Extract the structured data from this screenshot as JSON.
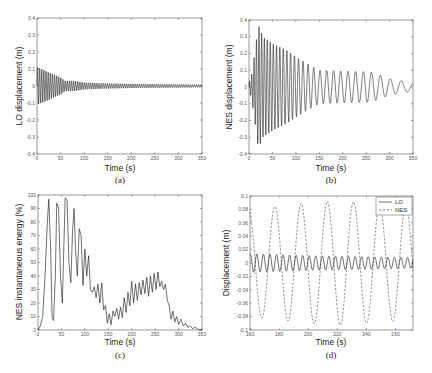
{
  "chart_data": [
    {
      "id": "a",
      "type": "line",
      "caption": "(a)",
      "xlabel": "Time (s)",
      "ylabel": "LO displacement (m)",
      "xlim": [
        0,
        350
      ],
      "ylim": [
        -0.4,
        0.4
      ],
      "xticks": [
        0,
        50,
        100,
        150,
        200,
        250,
        300,
        350
      ],
      "yticks": [
        -0.4,
        -0.3,
        -0.2,
        -0.1,
        0,
        0.1,
        0.2,
        0.3,
        0.4
      ],
      "ytick_labels": [
        "-0.4",
        "-0.3",
        "-0.2",
        "-0.1",
        "0",
        "0.1",
        "0.2",
        "0.3",
        "0.4"
      ],
      "grid": false,
      "series": [
        {
          "name": "LO",
          "style": "solid",
          "period_s": 4.5,
          "envelope": {
            "x": [
              0,
              10,
              30,
              50,
              60,
              80,
              100,
              150,
              200,
              350
            ],
            "y": [
              0.11,
              0.1,
              0.075,
              0.05,
              0.03,
              0.03,
              0.02,
              0.015,
              0.012,
              0.008
            ]
          }
        }
      ]
    },
    {
      "id": "b",
      "type": "line",
      "caption": "(b)",
      "xlabel": "Time (s)",
      "ylabel": "NES displacement (m)",
      "xlim": [
        0,
        350
      ],
      "ylim": [
        -0.4,
        0.4
      ],
      "xticks": [
        0,
        50,
        100,
        150,
        200,
        250,
        300,
        350
      ],
      "yticks": [
        -0.4,
        -0.3,
        -0.2,
        -0.1,
        0,
        0.1,
        0.2,
        0.3,
        0.4
      ],
      "ytick_labels": [
        "-0.4",
        "-0.3",
        "-0.2",
        "-0.1",
        "0",
        "0.1",
        "0.2",
        "0.3",
        "0.4"
      ],
      "grid": false,
      "series": [
        {
          "name": "NES",
          "style": "solid",
          "period_points": {
            "x": [
              0,
              20,
              100,
              150,
              250,
              300,
              350
            ],
            "y": [
              4.5,
              5.5,
              8.5,
              14,
              17,
              22,
              28
            ]
          },
          "envelope": {
            "x": [
              0,
              5,
              12,
              20,
              30,
              50,
              80,
              100,
              130,
              150,
              200,
              260,
              300,
              320,
              350
            ],
            "y": [
              0.03,
              0.06,
              0.2,
              0.37,
              0.3,
              0.26,
              0.22,
              0.18,
              0.13,
              0.1,
              0.095,
              0.09,
              0.05,
              0.04,
              0.025
            ]
          }
        }
      ]
    },
    {
      "id": "c",
      "type": "line",
      "caption": "(c)",
      "xlabel": "Time (s)",
      "ylabel": "NES instantaneous energy (%)",
      "xlim": [
        0,
        350
      ],
      "ylim": [
        0,
        100
      ],
      "xticks": [
        0,
        50,
        100,
        150,
        200,
        250,
        300,
        350
      ],
      "yticks": [
        0,
        10,
        20,
        30,
        40,
        50,
        60,
        70,
        80,
        90,
        100
      ],
      "ytick_labels": [
        "0",
        "10",
        "20",
        "30",
        "40",
        "50",
        "60",
        "70",
        "80",
        "90",
        "100"
      ],
      "grid": false,
      "series": [
        {
          "name": "NES energy",
          "style": "solid",
          "x": [
            0,
            5,
            10,
            15,
            20,
            23,
            27,
            30,
            33,
            37,
            40,
            44,
            48,
            52,
            55,
            58,
            62,
            66,
            70,
            74,
            77,
            80,
            84,
            88,
            92,
            96,
            100,
            104,
            108,
            112,
            116,
            120,
            124,
            128,
            132,
            136,
            140,
            144,
            148,
            152,
            156,
            160,
            164,
            168,
            172,
            176,
            180,
            184,
            188,
            192,
            196,
            200,
            204,
            208,
            212,
            216,
            220,
            224,
            228,
            232,
            236,
            240,
            244,
            248,
            252,
            256,
            260,
            264,
            268,
            272,
            276,
            280,
            284,
            288,
            292,
            296,
            300,
            305,
            310,
            315,
            320,
            325,
            330,
            335,
            340,
            345,
            350
          ],
          "y": [
            0,
            3,
            10,
            40,
            80,
            97,
            60,
            10,
            7,
            40,
            94,
            90,
            40,
            20,
            60,
            98,
            96,
            50,
            35,
            75,
            90,
            60,
            40,
            75,
            70,
            33,
            60,
            40,
            55,
            30,
            28,
            32,
            24,
            34,
            20,
            35,
            15,
            18,
            5,
            12,
            4,
            14,
            10,
            16,
            8,
            17,
            9,
            24,
            13,
            28,
            18,
            36,
            20,
            34,
            22,
            35,
            26,
            37,
            27,
            39,
            25,
            40,
            28,
            42,
            30,
            43,
            32,
            36,
            30,
            34,
            22,
            18,
            8,
            14,
            6,
            10,
            4,
            8,
            3,
            5,
            2,
            3,
            1,
            2,
            1,
            0,
            0
          ]
        }
      ]
    },
    {
      "id": "d",
      "type": "line",
      "caption": "(d)",
      "xlabel": "Time (s)",
      "ylabel": "Displacement (m)",
      "xlim": [
        160,
        272
      ],
      "ylim": [
        -0.1,
        0.1
      ],
      "xticks": [
        160,
        180,
        200,
        220,
        240,
        260
      ],
      "yticks": [
        -0.1,
        -0.08,
        -0.06,
        -0.04,
        -0.02,
        0,
        0.02,
        0.04,
        0.06,
        0.08,
        0.1
      ],
      "ytick_labels": [
        "-0.1",
        "-0.08",
        "-0.06",
        "-0.04",
        "-0.02",
        "0",
        "0.02",
        "0.04",
        "0.06",
        "0.08",
        "0.1"
      ],
      "grid": false,
      "legend": {
        "position": "upper right",
        "entries": [
          "LO",
          "NES"
        ]
      },
      "series": [
        {
          "name": "LO",
          "style": "solid",
          "period_s": 4.5,
          "amplitude": {
            "x": [
              160,
              200,
              272
            ],
            "y": [
              0.014,
              0.011,
              0.008
            ]
          },
          "phase": 0.2
        },
        {
          "name": "NES",
          "style": "dashed",
          "period_s": 18,
          "amplitude": {
            "x": [
              160,
              200,
              220,
              272
            ],
            "y": [
              0.08,
              0.09,
              0.093,
              0.085
            ]
          },
          "phase": 0.3
        }
      ]
    }
  ],
  "panels": {
    "a": {
      "caption": "(a)",
      "xlabel": "Time (s)",
      "ylabel": "LO displacement (m)"
    },
    "b": {
      "caption": "(b)",
      "xlabel": "Time (s)",
      "ylabel": "NES displacement (m)"
    },
    "c": {
      "caption": "(c)",
      "xlabel": "Time (s)",
      "ylabel": "NES instantaneous energy (%)"
    },
    "d": {
      "caption": "(d)",
      "xlabel": "Time (s)",
      "ylabel": "Displacement (m)",
      "legend": [
        "LO",
        "NES"
      ]
    }
  }
}
